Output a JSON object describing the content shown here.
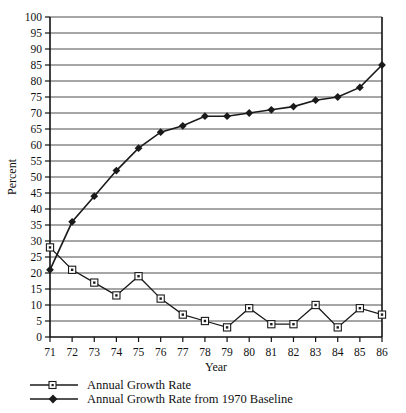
{
  "chart_data": {
    "type": "line",
    "title": "",
    "xlabel": "Year",
    "ylabel": "Percent",
    "xlim": [
      71,
      86
    ],
    "ylim": [
      0,
      100
    ],
    "ytick_step": 5,
    "grid": true,
    "legend_position": "bottom",
    "x": [
      71,
      72,
      73,
      74,
      75,
      76,
      77,
      78,
      79,
      80,
      81,
      82,
      83,
      84,
      85,
      86
    ],
    "xtick_labels": [
      "71",
      "72",
      "73",
      "74",
      "75",
      "76",
      "77",
      "78",
      "79",
      "80",
      "81",
      "82",
      "83",
      "84",
      "85",
      "86"
    ],
    "ytick_labels": [
      "0",
      "5",
      "10",
      "15",
      "20",
      "25",
      "30",
      "35",
      "40",
      "45",
      "50",
      "55",
      "60",
      "65",
      "70",
      "75",
      "80",
      "85",
      "90",
      "95",
      "100"
    ],
    "series": [
      {
        "name": "Annual Growth Rate",
        "marker": "open-square",
        "values": [
          28,
          21,
          17,
          13,
          19,
          12,
          7,
          5,
          3,
          9,
          4,
          4,
          10,
          3,
          9,
          7
        ]
      },
      {
        "name": "Annual Growth Rate from 1970 Baseline",
        "marker": "filled-diamond",
        "values": [
          21,
          36,
          44,
          52,
          59,
          64,
          66,
          69,
          69,
          70,
          71,
          72,
          74,
          75,
          78,
          85
        ]
      }
    ]
  },
  "axes": {
    "ylabel": "Percent",
    "xlabel": "Year"
  },
  "legend": {
    "items": [
      {
        "label": "Annual Growth Rate",
        "marker": "open-square"
      },
      {
        "label": "Annual Growth Rate from 1970 Baseline",
        "marker": "filled-diamond"
      }
    ]
  },
  "colors": {
    "line": "#1a1a1a",
    "grid": "#4d4d4d",
    "axis": "#111111",
    "marker_fill": "#ffffff",
    "background": "#ffffff"
  }
}
